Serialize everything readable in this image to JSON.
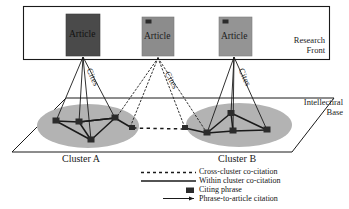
{
  "diagram": {
    "title_regions": {
      "research_front": "Research\nFront",
      "intellectual_base": "Intellectiral\nBase"
    },
    "articles": [
      {
        "label": "Article",
        "shade": "#4a4a4a",
        "has_phrase_icon": false
      },
      {
        "label": "Article",
        "shade": "#8c8c8c",
        "has_phrase_icon": true
      },
      {
        "label": "Article",
        "shade": "#949494",
        "has_phrase_icon": true
      }
    ],
    "cites_labels": [
      "Cites",
      "Cites",
      "Cites"
    ],
    "clusters": [
      {
        "label": "Cluster A"
      },
      {
        "label": "Cluster B"
      }
    ],
    "legend": [
      {
        "symbol": "dashed-line",
        "label": "Cross-cluster co-citation"
      },
      {
        "symbol": "solid-line",
        "label": "Within cluster co-citation"
      },
      {
        "symbol": "filled-square",
        "label": "Citing phrase"
      },
      {
        "symbol": "arrow-line",
        "label": "Phrase-to-article citation"
      }
    ],
    "colors": {
      "ellipse_fill": "#b3b3b3",
      "node_fill": "#2b2b2b",
      "line": "#1a1a1a",
      "frame": "#1a1a1a",
      "background": "#ffffff"
    }
  }
}
